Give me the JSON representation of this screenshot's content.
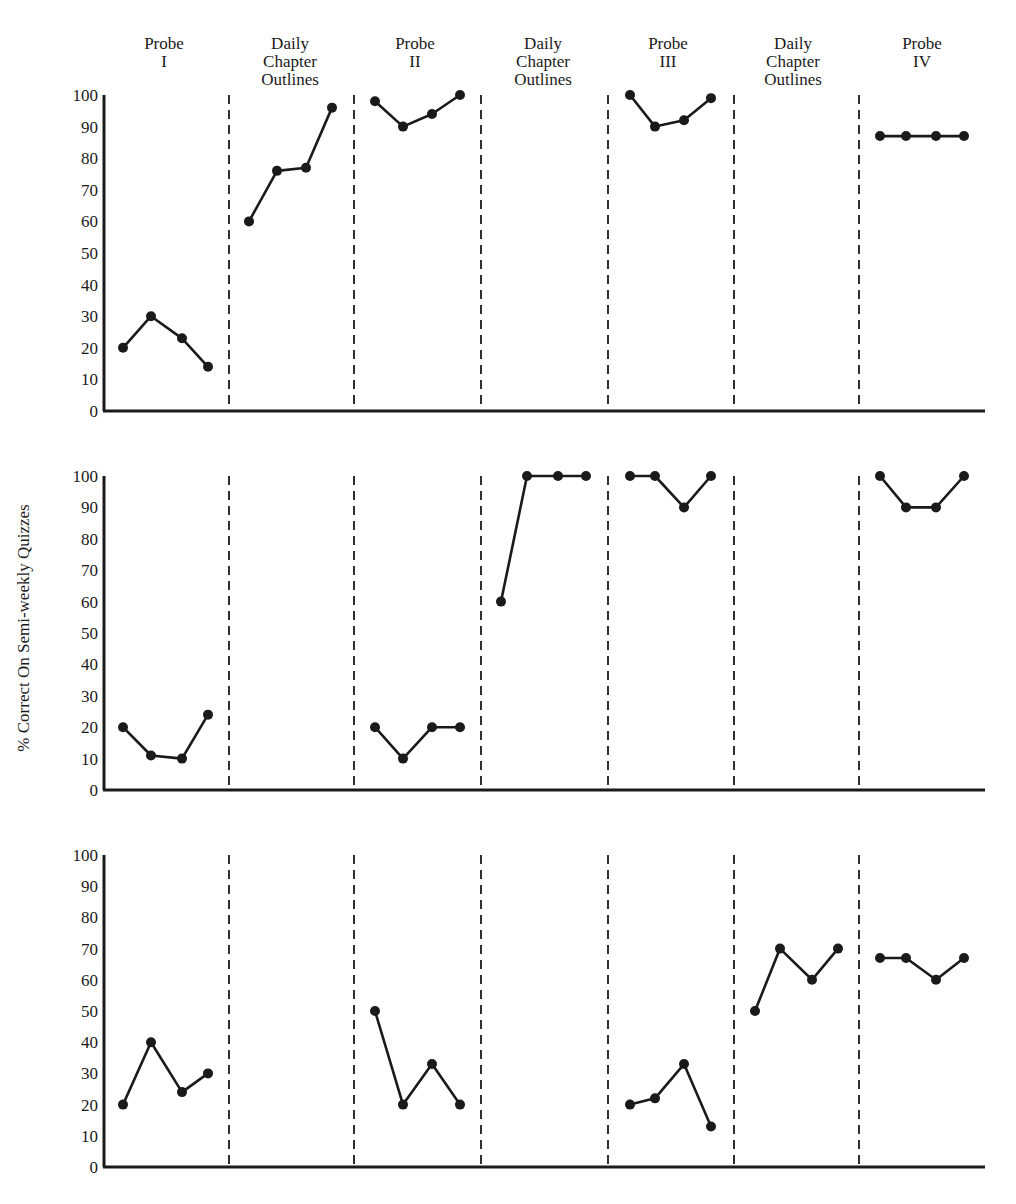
{
  "figure": {
    "y_axis_title": "% Correct On Semi-weekly Quizzes",
    "phase_labels": [
      {
        "lines": [
          "Probe",
          "I"
        ]
      },
      {
        "lines": [
          "Daily",
          "Chapter",
          "Outlines"
        ]
      },
      {
        "lines": [
          "Probe",
          "II"
        ]
      },
      {
        "lines": [
          "Daily",
          "Chapter",
          "Outlines"
        ]
      },
      {
        "lines": [
          "Probe",
          "III"
        ]
      },
      {
        "lines": [
          "Daily",
          "Chapter",
          "Outlines"
        ]
      },
      {
        "lines": [
          "Probe",
          "IV"
        ]
      }
    ],
    "y_ticks": [
      "0",
      "10",
      "20",
      "30",
      "40",
      "50",
      "60",
      "70",
      "80",
      "90",
      "100"
    ],
    "colors": {
      "ink": "#1a1a1a",
      "background": "#ffffff"
    }
  },
  "chart_data": {
    "type": "line",
    "title": "",
    "xlabel": "",
    "ylabel": "% Correct On Semi-weekly Quizzes",
    "ylim": [
      0,
      100
    ],
    "grid": false,
    "legend": "none",
    "phases": [
      "Probe I",
      "Daily Chapter Outlines",
      "Probe II",
      "Daily Chapter Outlines",
      "Probe III",
      "Daily Chapter Outlines",
      "Probe IV"
    ],
    "phase_dividers": "dashed vertical lines between phases",
    "panels": [
      {
        "name": "Panel 1 (top)",
        "segments": [
          {
            "phase": "Probe I",
            "values": [
              20,
              30,
              23,
              14
            ]
          },
          {
            "phase": "Daily Chapter Outlines",
            "values": [
              60,
              76,
              77,
              96
            ]
          },
          {
            "phase": "Probe II",
            "values": [
              98,
              90,
              94,
              100
            ]
          },
          {
            "phase": "Daily Chapter Outlines",
            "values": []
          },
          {
            "phase": "Probe III",
            "values": [
              100,
              90,
              92,
              99
            ]
          },
          {
            "phase": "Daily Chapter Outlines",
            "values": []
          },
          {
            "phase": "Probe IV",
            "values": [
              87,
              87,
              87,
              87
            ]
          }
        ]
      },
      {
        "name": "Panel 2 (middle)",
        "segments": [
          {
            "phase": "Probe I",
            "values": [
              20,
              11,
              10,
              24
            ]
          },
          {
            "phase": "Daily Chapter Outlines",
            "values": []
          },
          {
            "phase": "Probe II",
            "values": [
              20,
              10,
              20,
              20
            ]
          },
          {
            "phase": "Daily Chapter Outlines",
            "values": [
              60,
              100,
              100,
              100
            ]
          },
          {
            "phase": "Probe III",
            "values": [
              100,
              100,
              90,
              100
            ]
          },
          {
            "phase": "Daily Chapter Outlines",
            "values": []
          },
          {
            "phase": "Probe IV",
            "values": [
              100,
              90,
              90,
              100
            ]
          }
        ]
      },
      {
        "name": "Panel 3 (bottom)",
        "segments": [
          {
            "phase": "Probe I",
            "values": [
              20,
              40,
              24,
              30
            ]
          },
          {
            "phase": "Daily Chapter Outlines",
            "values": []
          },
          {
            "phase": "Probe II",
            "values": [
              50,
              20,
              33,
              20
            ]
          },
          {
            "phase": "Daily Chapter Outlines",
            "values": []
          },
          {
            "phase": "Probe III",
            "values": [
              20,
              22,
              33,
              13
            ]
          },
          {
            "phase": "Daily Chapter Outlines",
            "values": [
              50,
              70,
              60,
              70
            ]
          },
          {
            "phase": "Probe IV",
            "values": [
              67,
              67,
              60,
              67
            ]
          }
        ]
      }
    ]
  }
}
